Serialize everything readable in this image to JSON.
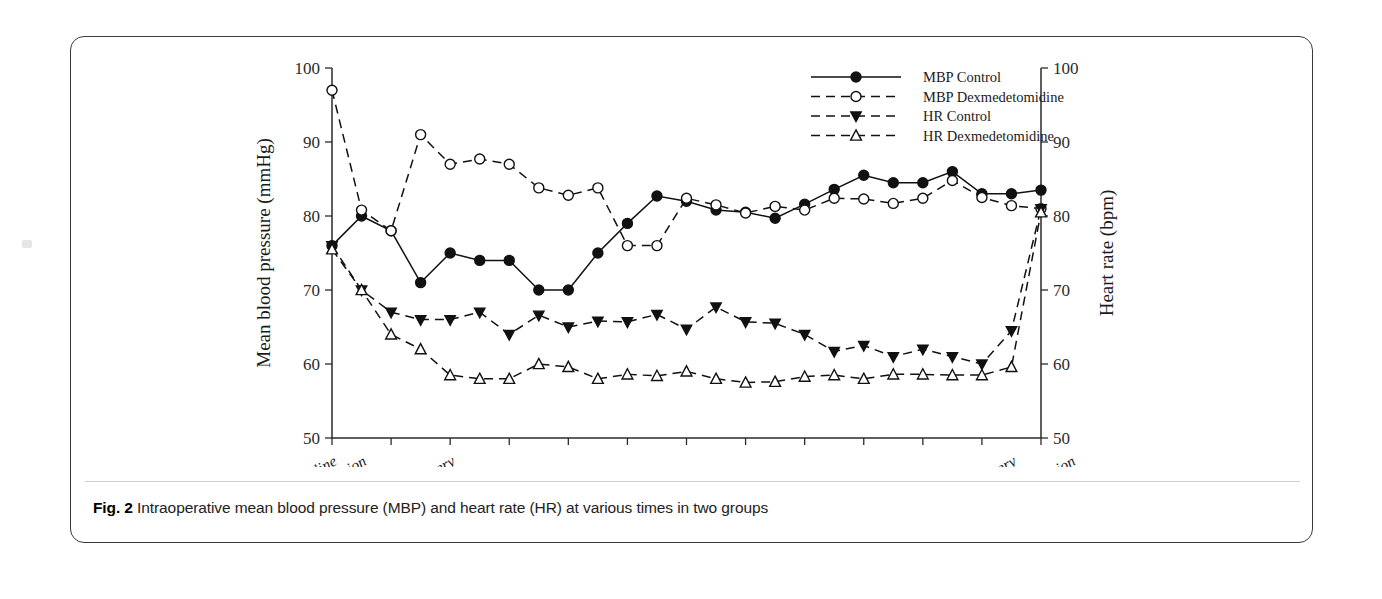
{
  "figure": {
    "caption_label": "Fig. 2",
    "caption_text": " Intraoperative mean blood pressure (MBP) and heart rate (HR) at various times in two groups"
  },
  "chart_data": {
    "type": "line",
    "title": "",
    "xlabel": "",
    "ylabel": "Mean blood pressure (mmHg)",
    "y2label": "Heart rate (bpm)",
    "ylim": [
      50,
      100
    ],
    "y2lim": [
      50,
      100
    ],
    "yticks": [
      50,
      60,
      70,
      80,
      90,
      100
    ],
    "y2ticks": [
      50,
      60,
      70,
      80,
      90,
      100
    ],
    "grid": false,
    "legend_position": "top-right",
    "xtick_labels": [
      "Baseline",
      "After intubation",
      "Start of surgery",
      "End of surgery",
      "After extubation"
    ],
    "xtick_label_indices": [
      0,
      1,
      4,
      23,
      25
    ],
    "n_points": 26,
    "series": [
      {
        "name": "MBP Control",
        "axis": "left",
        "marker": "filled-circle",
        "linestyle": "solid",
        "color": "#111111",
        "values": [
          76,
          80,
          78,
          71,
          75,
          74,
          74,
          70,
          70,
          75,
          79,
          82.7,
          82,
          80.8,
          80.5,
          79.7,
          81.6,
          83.6,
          85.5,
          84.5,
          84.5,
          86,
          83,
          83,
          83.5
        ]
      },
      {
        "name": "MBP Dexmedetomidine",
        "axis": "left",
        "marker": "open-circle",
        "linestyle": "dashed",
        "color": "#111111",
        "values": [
          97,
          80.8,
          78,
          91,
          87,
          87.7,
          87,
          83.8,
          82.8,
          83.8,
          76,
          76,
          82.4,
          81.5,
          80.4,
          81.3,
          80.8,
          82.4,
          82.3,
          81.7,
          82.4,
          84.8,
          82.5,
          81.4,
          81
        ]
      },
      {
        "name": "HR Control",
        "axis": "right",
        "marker": "filled-triangle-down",
        "linestyle": "dashed",
        "color": "#111111",
        "values": [
          76,
          70,
          67,
          66,
          66,
          67,
          64,
          66.6,
          65,
          65.8,
          65.7,
          66.7,
          64.7,
          67.7,
          65.7,
          65.5,
          64,
          61.7,
          62.5,
          61,
          62,
          61,
          60,
          64.5,
          81
        ]
      },
      {
        "name": "HR Dexmedetomidine",
        "axis": "right",
        "marker": "open-triangle-up",
        "linestyle": "dashed",
        "color": "#111111",
        "values": [
          75.5,
          70,
          64,
          62,
          58.5,
          58,
          58,
          60,
          59.6,
          58,
          58.6,
          58.4,
          59,
          58,
          57.5,
          57.6,
          58.3,
          58.5,
          58,
          58.6,
          58.6,
          58.5,
          58.5,
          59.6,
          80.5
        ]
      }
    ]
  },
  "legend": {
    "entries": [
      {
        "label": "MBP Control",
        "marker": "filled-circle",
        "linestyle": "solid"
      },
      {
        "label": "MBP Dexmedetomidine",
        "marker": "open-circle",
        "linestyle": "dashed"
      },
      {
        "label": "HR Control",
        "marker": "filled-triangle-down",
        "linestyle": "dashed"
      },
      {
        "label": "HR Dexmedetomidine",
        "marker": "open-triangle-up",
        "linestyle": "dashed"
      }
    ]
  }
}
